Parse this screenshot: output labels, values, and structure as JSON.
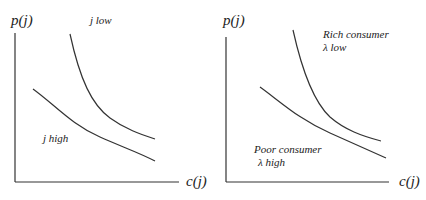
{
  "panels": [
    {
      "y_label": "p(j)",
      "x_label": "c(j)",
      "curves": [
        {
          "name": "upper",
          "label": "j low"
        },
        {
          "name": "lower",
          "label": "j high"
        }
      ]
    },
    {
      "y_label": "p(j)",
      "x_label": "c(j)",
      "curves": [
        {
          "name": "upper",
          "label_line1": "Rich consumer",
          "label_line2": "λ  low"
        },
        {
          "name": "lower",
          "label_line1": "Poor consumer",
          "label_line2": "λ high"
        }
      ]
    }
  ],
  "colors": {
    "line": "#333333",
    "background": "#ffffff"
  }
}
